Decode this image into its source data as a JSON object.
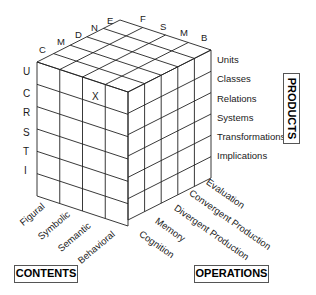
{
  "diagram": {
    "marker": "X",
    "top_left_letters": [
      "C",
      "M",
      "D",
      "N",
      "E"
    ],
    "top_right_letters": [
      "F",
      "S",
      "M",
      "B"
    ],
    "front_row_letters": [
      "U",
      "C",
      "R",
      "S",
      "T",
      "I"
    ],
    "products": [
      "Units",
      "Classes",
      "Relations",
      "Systems",
      "Transformations",
      "Implications"
    ],
    "contents": [
      "Figural",
      "Symbolic",
      "Semantic",
      "Behavioral"
    ],
    "operations": [
      "Evaluation",
      "Convergent Production",
      "Divergent Production",
      "Memory",
      "Cognition"
    ],
    "axis_labels": {
      "products": "PRODUCTS",
      "contents": "CONTENTS",
      "operations": "OPERATIONS"
    },
    "line_color": "#222222"
  }
}
